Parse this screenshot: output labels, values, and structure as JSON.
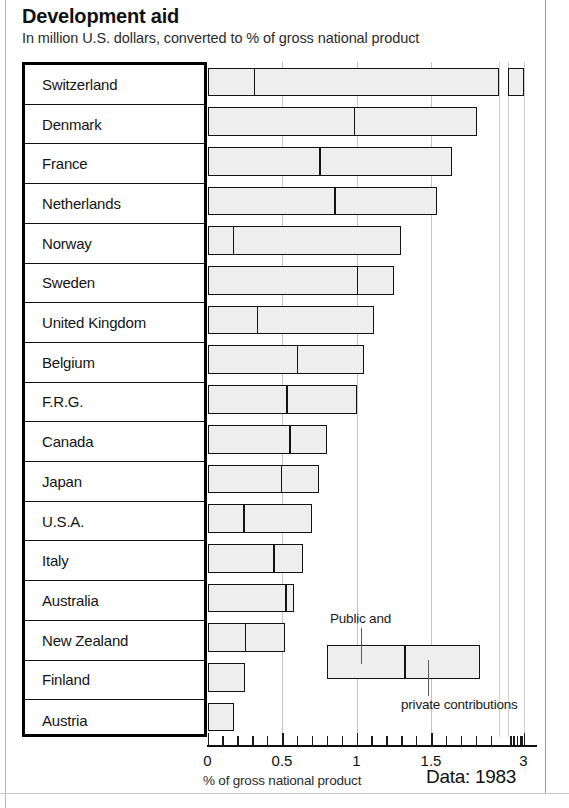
{
  "header": {
    "title": "Development aid",
    "subtitle": "In million U.S. dollars, converted to % of gross national product"
  },
  "footer": {
    "axis_caption": "% of gross national product",
    "data_stamp": "Data: 1983"
  },
  "legend": {
    "public_label": "Public and",
    "private_label": "private contributions",
    "public_value": 1.0,
    "private_value": 0.8
  },
  "axis": {
    "tick_labels": [
      "0",
      "0.5",
      "1",
      "1.5",
      "3"
    ],
    "tick_values": [
      0,
      0.5,
      1,
      1.5,
      3
    ],
    "has_break": true,
    "break_between": [
      1.95,
      2.0
    ]
  },
  "chart_data": {
    "type": "bar",
    "orientation": "horizontal",
    "stacked": true,
    "title": "Development aid",
    "subtitle": "In million U.S. dollars, converted to % of gross national product",
    "xlabel": "% of gross national product",
    "ylabel": "",
    "xlim": [
      0,
      3.05
    ],
    "xticks": [
      0,
      0.5,
      1,
      1.5,
      3
    ],
    "xticklabels": [
      "0",
      "0.5",
      "1",
      "1.5",
      "3"
    ],
    "axis_break": true,
    "grid": true,
    "legend": [
      "Public and",
      "private contributions"
    ],
    "legend_position": "inside-lower-right",
    "source": "Data: 1983",
    "categories": [
      "Switzerland",
      "Denmark",
      "France",
      "Netherlands",
      "Norway",
      "Sweden",
      "United Kingdom",
      "Belgium",
      "F.R.G.",
      "Canada",
      "Japan",
      "U.S.A.",
      "Italy",
      "Australia",
      "New Zealand",
      "Finland",
      "Austria"
    ],
    "series": [
      {
        "name": "Public and",
        "values": [
          0.31,
          0.98,
          0.75,
          0.85,
          0.17,
          1.0,
          0.33,
          0.6,
          0.53,
          0.55,
          0.49,
          0.24,
          0.44,
          0.52,
          0.25,
          0.25,
          0.18
        ]
      },
      {
        "name": "private contributions",
        "values": [
          2.74,
          0.83,
          0.89,
          0.69,
          1.13,
          0.25,
          0.79,
          0.45,
          0.47,
          0.25,
          0.26,
          0.46,
          0.2,
          0.06,
          0.27,
          0.0,
          0.0
        ]
      }
    ],
    "totals": [
      3.05,
      1.81,
      1.64,
      1.54,
      1.3,
      1.25,
      1.12,
      1.05,
      1.0,
      0.8,
      0.75,
      0.7,
      0.64,
      0.58,
      0.52,
      0.25,
      0.18
    ]
  }
}
